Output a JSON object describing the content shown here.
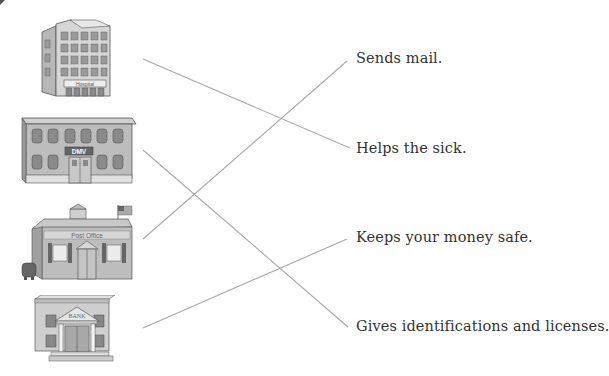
{
  "worksheet": {
    "type": "matching",
    "buildings": [
      {
        "id": "hospital",
        "sign": "Hospital"
      },
      {
        "id": "dmv",
        "sign": "DMV"
      },
      {
        "id": "post-office",
        "sign": "Post Office"
      },
      {
        "id": "bank",
        "sign": "BANK"
      }
    ],
    "descriptions": [
      {
        "id": "sends-mail",
        "text": "Sends mail."
      },
      {
        "id": "helps-sick",
        "text": "Helps the sick."
      },
      {
        "id": "keeps-money",
        "text": "Keeps your money safe."
      },
      {
        "id": "gives-ids",
        "text": "Gives identifications and licenses."
      }
    ],
    "matches": [
      {
        "from": "hospital",
        "to": "helps-sick"
      },
      {
        "from": "dmv",
        "to": "gives-ids"
      },
      {
        "from": "post-office",
        "to": "sends-mail"
      },
      {
        "from": "bank",
        "to": "keeps-money"
      }
    ],
    "colors": {
      "line": "#a9a9a9",
      "text": "#333333",
      "building_light": "#d8d8d8",
      "building_mid": "#b0b0b0",
      "building_dark": "#6e6e6e"
    }
  }
}
